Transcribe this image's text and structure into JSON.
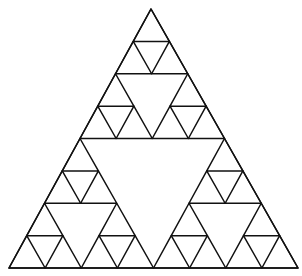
{
  "diagram": {
    "type": "sierpinski-triangle",
    "depth": 3,
    "apex": [
      151,
      9
    ],
    "bottom_left": [
      9,
      268
    ],
    "bottom_right": [
      298,
      268
    ],
    "stroke_color": "#111111",
    "background_color": "#ffffff",
    "stroke_width": 1.5
  }
}
